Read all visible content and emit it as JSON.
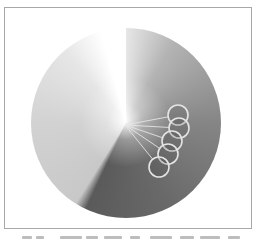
{
  "figure": {
    "type": "conic-gradient-disk",
    "disk": {
      "cx": 126,
      "cy": 123,
      "r": 95
    },
    "gradient_stops": [
      {
        "angle": -15,
        "color": "#ffffff"
      },
      {
        "angle": 30,
        "color": "#b4b4b4"
      },
      {
        "angle": 90,
        "color": "#858585"
      },
      {
        "angle": 150,
        "color": "#6a6a6a"
      },
      {
        "angle": 205,
        "color": "#5a5a5a"
      },
      {
        "angle": 212,
        "color": "#c8c8c8"
      },
      {
        "angle": 270,
        "color": "#d2d2d2"
      },
      {
        "angle": 320,
        "color": "#e6e6e6"
      },
      {
        "angle": 345,
        "color": "#ffffff"
      }
    ],
    "center_point": {
      "x": 125,
      "y": 125
    },
    "circles": [
      {
        "cx": 178,
        "cy": 115,
        "r": 10
      },
      {
        "cx": 179,
        "cy": 128,
        "r": 10
      },
      {
        "cx": 172,
        "cy": 141,
        "r": 10
      },
      {
        "cx": 168,
        "cy": 154,
        "r": 10
      },
      {
        "cx": 159,
        "cy": 167,
        "r": 10
      }
    ],
    "colors": {
      "circle_stroke": "#e4e4e4",
      "ray_stroke": "#e8e8e8",
      "frame_border": "#a8a8a8"
    }
  }
}
